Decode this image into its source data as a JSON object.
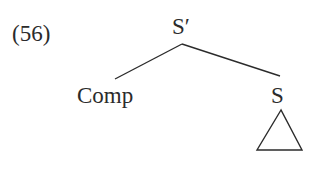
{
  "example": {
    "number": "(56)"
  },
  "tree": {
    "root": "S′",
    "left_child": "Comp",
    "right_child": "S",
    "right_child_subtree": "triangle",
    "cutoff_text": "…"
  },
  "colors": {
    "ink": "#2b2b2b",
    "background": "#ffffff"
  }
}
